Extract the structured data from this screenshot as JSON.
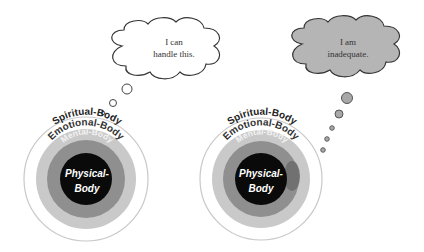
{
  "diagram": {
    "title": "",
    "colors": {
      "spiritual": "#ffffff",
      "emotional": "#c9c9c9",
      "mental": "#8f8f8f",
      "physical": "#0a0a0a",
      "cloud_positive": "#ffffff",
      "cloud_negative": "#b5b5b5",
      "stain": "#6e6e6e"
    },
    "left": {
      "thought_line1": "I can",
      "thought_line2": "handle this.",
      "layers": {
        "spiritual": "Spiritual-Body",
        "emotional": "Emotional-Body",
        "mental": "Mental-Body",
        "physical_line1": "Physical-",
        "physical_line2": "Body"
      }
    },
    "right": {
      "thought_line1": "I am",
      "thought_line2": "inadequate.",
      "layers": {
        "spiritual": "Spiritual-Body",
        "emotional": "Emotional-Body",
        "mental": "Mental-Body",
        "physical_line1": "Physical-",
        "physical_line2": "Body"
      }
    }
  }
}
